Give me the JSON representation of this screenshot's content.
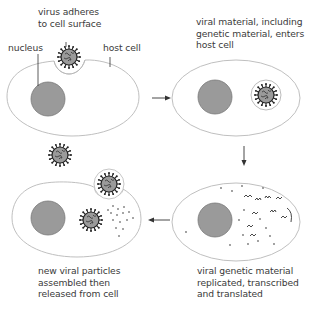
{
  "diagram": {
    "colors": {
      "cell_outline": "#b8b8b8",
      "nucleus_fill": "#9a9a9a",
      "nucleus_stroke": "#7a7a7a",
      "virus_body": "#8c8c8c",
      "virus_spikes": "#222222",
      "arrow": "#333333",
      "text": "#3a3a3a"
    },
    "labels": {
      "virus_adheres": [
        "virus adheres",
        "to cell surface"
      ],
      "nucleus": "nucleus",
      "host_cell": "host cell",
      "enters": [
        "viral material, including",
        "genetic material, enters",
        "host cell"
      ],
      "replicated": [
        "viral genetic material",
        "replicated, transcribed",
        "and translated"
      ],
      "released": [
        "new viral particles",
        "assembled then",
        "released from cell"
      ]
    },
    "stages": [
      {
        "id": 1,
        "position": "top-left",
        "description": "virus adheres to cell surface"
      },
      {
        "id": 2,
        "position": "top-right",
        "description": "viral material, including genetic material, enters host cell"
      },
      {
        "id": 3,
        "position": "bottom-right",
        "description": "viral genetic material replicated, transcribed and translated"
      },
      {
        "id": 4,
        "position": "bottom-left",
        "description": "new viral particles assembled then released from cell"
      }
    ],
    "arrows": [
      {
        "from": 1,
        "to": 2,
        "direction": "right"
      },
      {
        "from": 2,
        "to": 3,
        "direction": "down"
      },
      {
        "from": 3,
        "to": 4,
        "direction": "left"
      }
    ]
  }
}
